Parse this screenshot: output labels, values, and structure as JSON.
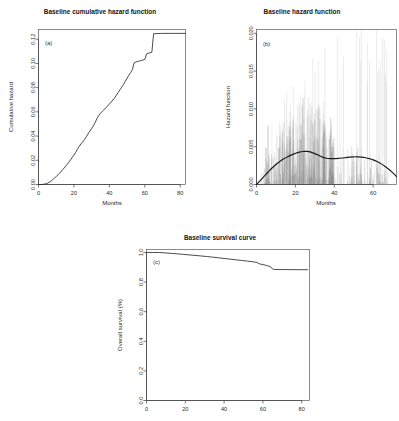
{
  "figure": {
    "background": "#ffffff",
    "line_color": "#2a2a2a",
    "spike_color": "#8c8c8c"
  },
  "panels": {
    "a": {
      "tag": "(a)",
      "title": "Baseline cumulative hazard function",
      "xlabel": "Months",
      "ylabel": "Cumulative hazard"
    },
    "b": {
      "tag": "(b)",
      "title": "Baseline hazard function",
      "xlabel": "Months",
      "ylabel": "Hazard function"
    },
    "c": {
      "tag": "(c)",
      "title": "Baseline survival curve",
      "xlabel": "",
      "ylabel": "Overall survival (%)"
    }
  },
  "chart_data": [
    {
      "type": "line",
      "panel": "a",
      "title": "Baseline cumulative hazard function",
      "xlabel": "Months",
      "ylabel": "Cumulative hazard",
      "xlim": [
        0,
        83
      ],
      "ylim": [
        0.0,
        0.128
      ],
      "xticks": [
        0,
        20,
        40,
        60,
        80
      ],
      "xticklabels": [
        "0",
        "20",
        "40",
        "60",
        "80"
      ],
      "yticks": [
        0.0,
        0.02,
        0.04,
        0.06,
        0.08,
        0.1,
        0.12
      ],
      "yticklabels": [
        "0.00",
        "0.02",
        "0.04",
        "0.06",
        "0.08",
        "0.10",
        "0.12"
      ],
      "grid": false,
      "legend": false,
      "x": [
        0,
        2,
        4,
        5,
        6,
        7,
        8,
        9,
        10,
        11,
        12,
        13,
        14,
        15,
        16,
        17,
        18,
        19,
        20,
        21,
        22,
        23,
        24,
        25,
        26,
        27,
        28,
        29,
        30,
        31,
        32,
        33,
        34,
        35,
        36,
        37,
        38,
        39,
        40,
        41,
        42,
        43,
        44,
        45,
        46,
        47,
        48,
        49,
        50,
        51,
        52,
        53,
        54,
        55,
        56,
        57,
        58,
        59,
        60,
        61,
        62,
        63,
        64,
        65,
        70,
        75,
        80,
        83
      ],
      "y": [
        0.0,
        0.0,
        0.0005,
        0.001,
        0.0018,
        0.0028,
        0.004,
        0.0053,
        0.0066,
        0.008,
        0.0095,
        0.0112,
        0.0128,
        0.0145,
        0.0163,
        0.0182,
        0.0202,
        0.0222,
        0.0243,
        0.0266,
        0.029,
        0.0315,
        0.0336,
        0.0352,
        0.0372,
        0.0395,
        0.0418,
        0.0441,
        0.0462,
        0.0486,
        0.0512,
        0.0545,
        0.057,
        0.0588,
        0.0604,
        0.0618,
        0.0632,
        0.0648,
        0.0664,
        0.068,
        0.0698,
        0.0716,
        0.0738,
        0.076,
        0.0782,
        0.0804,
        0.0826,
        0.0852,
        0.0878,
        0.0902,
        0.0924,
        0.0948,
        0.1005,
        0.1012,
        0.1016,
        0.102,
        0.1024,
        0.1028,
        0.1032,
        0.1078,
        0.1084,
        0.1088,
        0.1092,
        0.1245,
        0.1248,
        0.1248,
        0.1248,
        0.1248
      ]
    },
    {
      "type": "line",
      "panel": "b",
      "title": "Baseline hazard function",
      "xlabel": "Months",
      "ylabel": "Hazard function",
      "xlim": [
        0,
        72
      ],
      "ylim": [
        0.0,
        0.0205
      ],
      "xticks": [
        0,
        20,
        40,
        60
      ],
      "xticklabels": [
        "0",
        "20",
        "40",
        "60"
      ],
      "yticks": [
        0.0,
        0.005,
        0.01,
        0.015,
        0.02
      ],
      "yticklabels": [
        "0.000",
        "0.005",
        "0.010",
        "0.015",
        "0.020"
      ],
      "grid": false,
      "legend": false,
      "series": [
        {
          "name": "smoothed hazard",
          "x": [
            0,
            2,
            4,
            6,
            8,
            10,
            12,
            14,
            16,
            18,
            20,
            22,
            24,
            26,
            28,
            30,
            32,
            34,
            36,
            38,
            40,
            42,
            44,
            46,
            48,
            50,
            52,
            54,
            56,
            58,
            60,
            62,
            64,
            66,
            68,
            70,
            72
          ],
          "y": [
            0.0,
            0.00055,
            0.0011,
            0.00165,
            0.00218,
            0.00265,
            0.00305,
            0.0034,
            0.00368,
            0.00392,
            0.00412,
            0.00428,
            0.00437,
            0.00438,
            0.00428,
            0.00408,
            0.00385,
            0.00362,
            0.00347,
            0.00342,
            0.00342,
            0.00345,
            0.0035,
            0.00356,
            0.00362,
            0.00366,
            0.00366,
            0.00362,
            0.00354,
            0.00342,
            0.00326,
            0.00304,
            0.00276,
            0.00242,
            0.00202,
            0.00156,
            0.00105
          ]
        }
      ],
      "spikes_note": "dense vertical event-time spikes, tallest clustered between months 10-35, sparse tall spikes to 0.020 between months 40-68"
    },
    {
      "type": "line",
      "panel": "c",
      "title": "Baseline survival curve",
      "xlabel": "",
      "ylabel": "Overall survival (%)",
      "xlim": [
        0,
        84
      ],
      "ylim": [
        0.0,
        1.02
      ],
      "xticks": [
        0,
        20,
        40,
        60,
        80
      ],
      "xticklabels": [
        "0",
        "20",
        "40",
        "60",
        "80"
      ],
      "yticks": [
        0.0,
        0.2,
        0.4,
        0.6,
        0.8,
        1.0
      ],
      "yticklabels": [
        "0.0",
        "0.2",
        "0.4",
        "0.6",
        "0.8",
        "1.0"
      ],
      "grid": false,
      "legend": false,
      "x": [
        0,
        3,
        6,
        8,
        10,
        13,
        16,
        19,
        22,
        25,
        28,
        31,
        34,
        37,
        40,
        43,
        46,
        49,
        52,
        55,
        57,
        58,
        60,
        62,
        64,
        65,
        66,
        70,
        75,
        80,
        83
      ],
      "y": [
        1.0,
        1.0,
        0.9995,
        0.999,
        0.9965,
        0.9935,
        0.9905,
        0.987,
        0.9835,
        0.98,
        0.9765,
        0.9725,
        0.9685,
        0.964,
        0.9595,
        0.955,
        0.9505,
        0.946,
        0.9415,
        0.937,
        0.932,
        0.9235,
        0.918,
        0.912,
        0.9025,
        0.8875,
        0.885,
        0.8845,
        0.884,
        0.8835,
        0.8835
      ]
    }
  ]
}
